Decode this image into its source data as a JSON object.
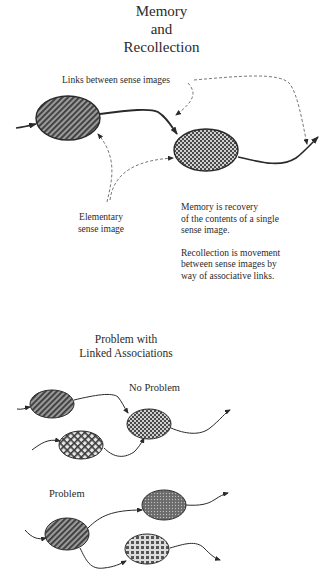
{
  "title": {
    "line1": "Memory",
    "line2": "and",
    "line3": "Recollection"
  },
  "top_diagram": {
    "links_label": "Links between sense images",
    "elementary_label_line1": "Elementary",
    "elementary_label_line2": "sense image",
    "memory_text": [
      "Memory is recovery",
      "of the contents of a single",
      "sense image."
    ],
    "recollection_text": [
      "Recollection is movement",
      "between sense images by",
      "way of associative links."
    ]
  },
  "bottom_section": {
    "title_line1": "Problem with",
    "title_line2": "Linked Associations",
    "no_problem_label": "No Problem",
    "problem_label": "Problem"
  },
  "colors": {
    "ink": "#2a2a2a",
    "dashed": "#555555",
    "background": "#ffffff"
  }
}
